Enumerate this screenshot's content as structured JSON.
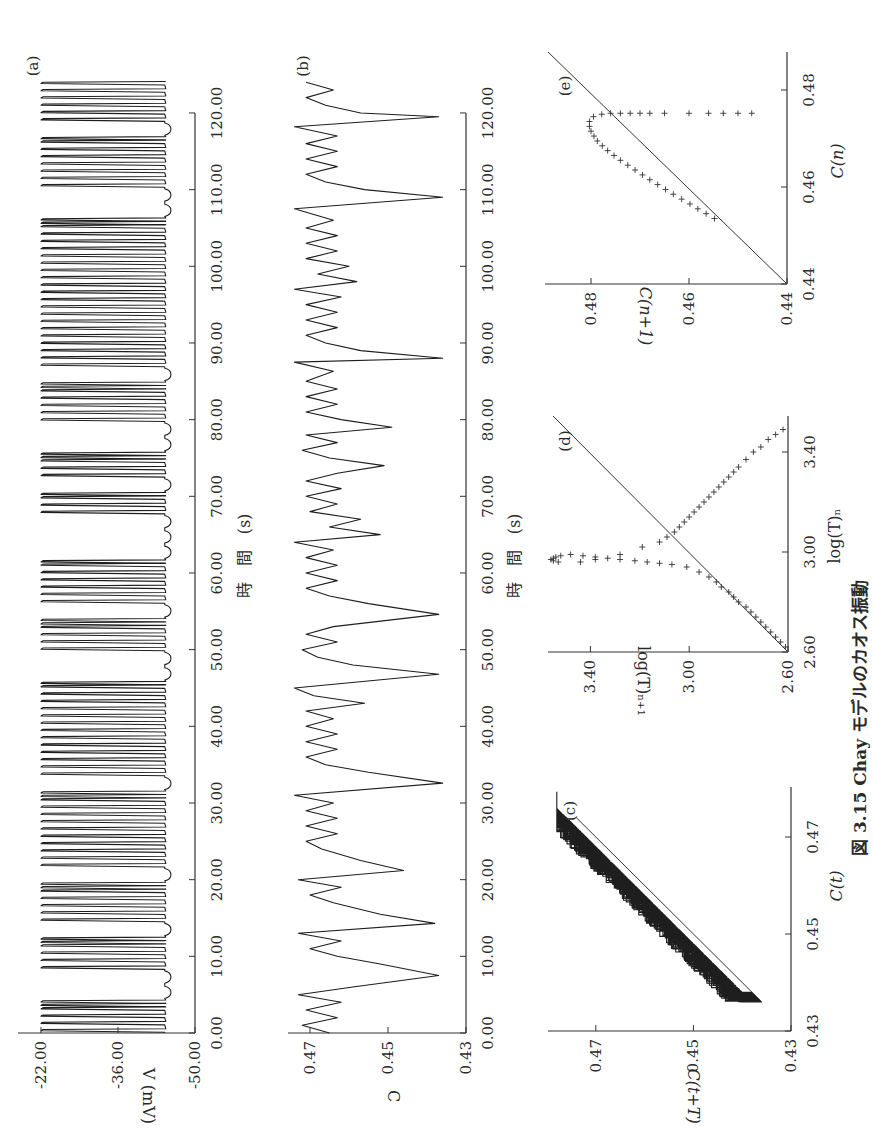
{
  "figure": {
    "orientation": "rotated -90deg (page scanned sideways)",
    "caption": "図 3.15 Chay モデルのカオス振動",
    "panels": {
      "a": {
        "label": "(a)",
        "ylabel": "V (mV)",
        "xlabel": "時　間　(s)",
        "yticks": [
          "-22.00",
          "-36.00",
          "-50.00"
        ],
        "xticks": [
          "0.00",
          "10.00",
          "20.00",
          "30.00",
          "40.00",
          "50.00",
          "60.00",
          "70.00",
          "80.00",
          "90.00",
          "100.00",
          "110.00",
          "120.00"
        ]
      },
      "b": {
        "label": "(b)",
        "ylabel": "C",
        "xlabel": "時　間　(s)",
        "yticks": [
          "0.47",
          "0.45",
          "0.43"
        ],
        "xticks": [
          "0.00",
          "10.00",
          "20.00",
          "30.00",
          "40.00",
          "50.00",
          "60.00",
          "70.00",
          "80.00",
          "90.00",
          "100.00",
          "110.00",
          "120.00"
        ]
      },
      "c": {
        "label": "(c)",
        "xlabel": "C(t)",
        "ylabel": "C(t+T)",
        "xticks": [
          "0.43",
          "0.45",
          "0.47"
        ],
        "yticks": [
          "0.47",
          "0.45",
          "0.43"
        ]
      },
      "d": {
        "label": "(d)",
        "xlabel": "log(T)ₙ",
        "ylabel": "log(T)ₙ₊₁",
        "xticks": [
          "2.60",
          "3.00",
          "3.40"
        ],
        "yticks": [
          "3.40",
          "3.00",
          "2.60"
        ]
      },
      "e": {
        "label": "(e)",
        "xlabel": "C(n)",
        "ylabel": "C(n+1)",
        "xticks": [
          "0.44",
          "0.46",
          "0.48"
        ],
        "yticks": [
          "0.48",
          "0.46",
          "0.44"
        ]
      }
    }
  },
  "chart_data": [
    {
      "id": "a",
      "type": "line",
      "title": "(a)",
      "xlabel": "時間 (s)",
      "ylabel": "V (mV)",
      "xlim": [
        0,
        120
      ],
      "ylim": [
        -50,
        -22
      ],
      "grid": false,
      "description": "Bursting membrane potential; spikes reach about -22 mV, interburst minima near -46 mV; bursts separated by quiescent troughs",
      "burst_gaps_s": [
        5.5,
        13.5,
        20.5,
        32.5,
        47.0,
        55.0,
        63.0,
        66.0,
        71.5,
        77.0,
        86.0,
        107.5,
        118.0
      ],
      "spike_peak_mV": -22,
      "trough_mV": -46
    },
    {
      "id": "b",
      "type": "line",
      "title": "(b)",
      "xlabel": "時間 (s)",
      "ylabel": "C",
      "xlim": [
        0,
        120
      ],
      "ylim": [
        0.43,
        0.475
      ],
      "grid": false,
      "x": [
        0,
        1,
        2,
        3,
        4,
        5,
        6,
        7.5,
        9,
        10,
        11,
        12,
        13,
        14.3,
        15.5,
        17,
        18,
        19,
        20,
        21.2,
        22.5,
        24,
        25,
        26,
        27,
        28,
        29,
        30,
        31,
        32.6,
        34,
        35,
        36,
        37,
        38,
        39,
        40,
        41,
        42,
        43,
        44,
        45,
        46.8,
        48,
        49,
        50,
        51,
        52,
        53,
        54.6,
        56,
        57,
        58,
        59,
        60,
        61,
        62,
        63,
        64,
        65,
        66,
        67,
        68,
        69,
        70,
        71,
        72,
        73,
        74,
        75,
        76,
        77,
        78,
        79,
        80,
        81,
        82,
        83,
        84,
        85,
        86.3,
        87.5,
        88,
        89,
        90,
        91,
        92,
        93,
        94,
        95,
        96,
        97,
        98,
        99,
        100,
        101,
        102,
        103,
        104,
        105,
        106,
        107.5,
        109,
        110,
        111,
        112,
        113,
        114,
        115,
        116,
        117,
        118.2,
        119.5,
        120,
        121,
        122,
        123,
        124
      ],
      "values": [
        0.465,
        0.472,
        0.463,
        0.471,
        0.462,
        0.473,
        0.459,
        0.437,
        0.452,
        0.463,
        0.47,
        0.462,
        0.473,
        0.438,
        0.452,
        0.464,
        0.47,
        0.462,
        0.473,
        0.446,
        0.457,
        0.467,
        0.471,
        0.463,
        0.471,
        0.463,
        0.471,
        0.464,
        0.474,
        0.436,
        0.455,
        0.466,
        0.471,
        0.463,
        0.471,
        0.463,
        0.471,
        0.464,
        0.471,
        0.456,
        0.469,
        0.474,
        0.437,
        0.459,
        0.468,
        0.472,
        0.463,
        0.471,
        0.464,
        0.437,
        0.455,
        0.465,
        0.471,
        0.463,
        0.471,
        0.463,
        0.471,
        0.464,
        0.474,
        0.452,
        0.465,
        0.457,
        0.47,
        0.463,
        0.471,
        0.462,
        0.471,
        0.463,
        0.451,
        0.465,
        0.472,
        0.463,
        0.471,
        0.449,
        0.462,
        0.471,
        0.463,
        0.471,
        0.463,
        0.471,
        0.464,
        0.474,
        0.436,
        0.457,
        0.466,
        0.471,
        0.463,
        0.471,
        0.463,
        0.471,
        0.462,
        0.474,
        0.458,
        0.468,
        0.46,
        0.471,
        0.463,
        0.471,
        0.463,
        0.471,
        0.464,
        0.474,
        0.436,
        0.456,
        0.466,
        0.471,
        0.463,
        0.471,
        0.463,
        0.471,
        0.463,
        0.474,
        0.437,
        0.457,
        0.466,
        0.471,
        0.464,
        0.471,
        0.464,
        0.471
      ]
    },
    {
      "id": "c",
      "type": "line",
      "title": "(c)",
      "xlabel": "C(t)",
      "ylabel": "C(t+T)",
      "xlim": [
        0.43,
        0.48
      ],
      "ylim": [
        0.43,
        0.48
      ],
      "description": "Delay-embedding attractor: dense band of staircase trajectories lying above the diagonal from (0.436,0.436) to (0.474,0.478)",
      "band_lower_edge": [
        [
          0.436,
          0.436
        ],
        [
          0.474,
          0.474
        ]
      ],
      "band_upper_edge": [
        [
          0.436,
          0.438
        ],
        [
          0.47,
          0.478
        ]
      ]
    },
    {
      "id": "d",
      "type": "scatter",
      "title": "(d)",
      "xlabel": "log(T)ₙ",
      "ylabel": "log(T)ₙ₊₁",
      "xlim": [
        2.6,
        3.5
      ],
      "ylim": [
        2.6,
        3.6
      ],
      "identity_line": true,
      "x": [
        2.62,
        2.64,
        2.66,
        2.68,
        2.7,
        2.72,
        2.74,
        2.76,
        2.78,
        2.8,
        2.82,
        2.84,
        2.86,
        2.88,
        2.9,
        2.92,
        2.94,
        2.95,
        2.955,
        2.96,
        2.965,
        2.97,
        2.975,
        2.98,
        2.985,
        2.99,
        2.985,
        2.98,
        2.975,
        2.97,
        2.965,
        2.96,
        2.96,
        2.97,
        2.99,
        3.02,
        3.04,
        3.06,
        3.08,
        3.1,
        3.12,
        3.14,
        3.16,
        3.18,
        3.2,
        3.22,
        3.24,
        3.26,
        3.28,
        3.3,
        3.32,
        3.34,
        3.37,
        3.4,
        3.42,
        3.45,
        3.47,
        3.49
      ],
      "values": [
        2.61,
        2.63,
        2.65,
        2.67,
        2.69,
        2.71,
        2.73,
        2.75,
        2.77,
        2.8,
        2.82,
        2.84,
        2.87,
        2.89,
        2.92,
        2.96,
        3.01,
        3.07,
        3.12,
        3.17,
        3.22,
        3.28,
        3.33,
        3.38,
        3.43,
        3.48,
        3.52,
        3.54,
        3.55,
        3.56,
        3.55,
        3.53,
        3.44,
        3.38,
        3.28,
        3.19,
        3.12,
        3.09,
        3.06,
        3.04,
        3.02,
        3.0,
        2.98,
        2.96,
        2.94,
        2.92,
        2.9,
        2.88,
        2.86,
        2.84,
        2.82,
        2.8,
        2.77,
        2.74,
        2.71,
        2.68,
        2.65,
        2.62
      ]
    },
    {
      "id": "e",
      "type": "scatter",
      "title": "(e)",
      "xlabel": "C(n)",
      "ylabel": "C(n+1)",
      "xlim": [
        0.44,
        0.49
      ],
      "ylim": [
        0.44,
        0.49
      ],
      "identity_line": true,
      "x": [
        0.4535,
        0.4545,
        0.4555,
        0.4565,
        0.4575,
        0.4585,
        0.4595,
        0.4605,
        0.4615,
        0.4625,
        0.4635,
        0.4645,
        0.4655,
        0.4665,
        0.4675,
        0.4685,
        0.4695,
        0.4705,
        0.4715,
        0.4725,
        0.4735,
        0.4745,
        0.475,
        0.4752,
        0.4752,
        0.4752,
        0.4752,
        0.4752,
        0.4752,
        0.4752,
        0.4752,
        0.4752,
        0.4752,
        0.4752
      ],
      "values": [
        0.4548,
        0.4565,
        0.4582,
        0.4598,
        0.4615,
        0.4632,
        0.4648,
        0.4664,
        0.468,
        0.4695,
        0.471,
        0.4725,
        0.474,
        0.4753,
        0.4766,
        0.4777,
        0.4787,
        0.4794,
        0.48,
        0.4803,
        0.4803,
        0.4795,
        0.4778,
        0.476,
        0.474,
        0.472,
        0.47,
        0.468,
        0.465,
        0.46,
        0.456,
        0.453,
        0.45,
        0.4472
      ]
    }
  ]
}
